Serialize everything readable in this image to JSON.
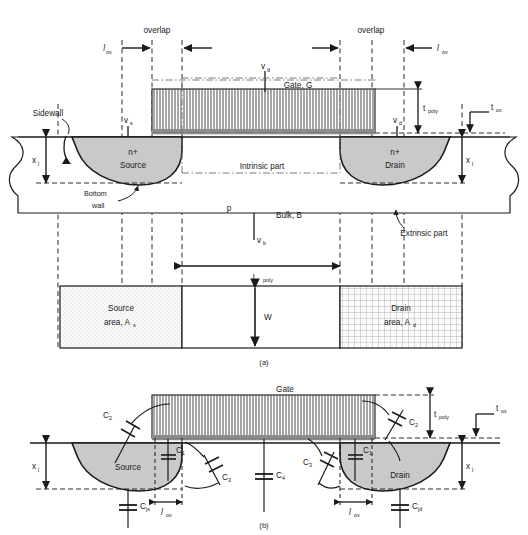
{
  "figure": {
    "panel_a_caption": "(a)",
    "panel_b_caption": "(b)",
    "colors": {
      "ink": "#1a1a1a",
      "diffusion_fill": "#c9c9c9",
      "gate_hatch": "#6e6e6e",
      "background": "#ffffff",
      "source_area_fill": "#f2f2f2",
      "drain_area_fill": "#f0f0f0"
    }
  },
  "panel_a": {
    "caption": "(a)",
    "labels": {
      "overlap_left": "overlap",
      "overlap_right": "overlap",
      "l_ov_left": "l",
      "l_ov_left_sub": "ov",
      "l_ov_right": "l",
      "l_ov_right_sub": "ov",
      "v_g": "v",
      "v_g_sub": "g",
      "v_s": "v",
      "v_s_sub": "s",
      "v_d": "v",
      "v_d_sub": "d",
      "v_b": "v",
      "v_b_sub": "b",
      "gate": "Gate, G",
      "sidewall": "Sidewall",
      "bottom_wall_line1": "Bottom",
      "bottom_wall_line2": "wall",
      "source_n": "n+",
      "source": "Source",
      "drain_n": "n+",
      "drain": "Drain",
      "intrinsic_part": "Intrinsic part",
      "extrinsic_part": "Extrinsic part",
      "bulk_p": "p",
      "bulk": "Bulk, B",
      "t_poly": "t",
      "t_poly_sub": "poly",
      "t_ox": "t",
      "t_ox_sub": "ox",
      "x_j_left": "x",
      "x_j_left_sub": "j",
      "x_j_right": "x",
      "x_j_right_sub": "j",
      "l_poly": "L",
      "l_poly_sub": "poly",
      "w": "W",
      "source_area_line1": "Source",
      "source_area_line2": "area, A",
      "source_area_sub": "s",
      "drain_area_line1": "Drain",
      "drain_area_line2": "area, A",
      "drain_area_sub": "d"
    }
  },
  "panel_b": {
    "caption": "(b)",
    "labels": {
      "gate": "Gate",
      "source": "Source",
      "drain": "Drain",
      "t_poly": "t",
      "t_poly_sub": "poly",
      "t_ox": "t",
      "t_ox_sub": "ox",
      "x_j_left": "x",
      "x_j_left_sub": "j",
      "x_j_right": "x",
      "x_j_right_sub": "j",
      "l_ov_left": "l",
      "l_ov_left_sub": "ov",
      "l_ov_right": "l",
      "l_ov_right_sub": "ov",
      "c2_left": "C",
      "c2_left_sub": "2",
      "c2_right": "C",
      "c2_right_sub": "2",
      "c1_left": "C",
      "c1_left_sub": "1",
      "c1_right": "C",
      "c1_right_sub": "1",
      "c3_left": "C",
      "c3_left_sub": "3",
      "c3_right": "C",
      "c3_right_sub": "3",
      "c4": "C",
      "c4_sub": "4",
      "cjs": "C",
      "cjs_sub": "js",
      "cjd": "C",
      "cjd_sub": "jd"
    }
  }
}
